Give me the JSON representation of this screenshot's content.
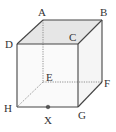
{
  "diagram": {
    "type": "cube",
    "vertices": {
      "A": {
        "label": "A",
        "x": 43,
        "y": 20
      },
      "B": {
        "label": "B",
        "x": 102,
        "y": 20
      },
      "C": {
        "label": "C",
        "x": 78,
        "y": 44
      },
      "D": {
        "label": "D",
        "x": 17,
        "y": 44
      },
      "E": {
        "label": "E",
        "x": 43,
        "y": 82
      },
      "F": {
        "label": "F",
        "x": 102,
        "y": 82
      },
      "G": {
        "label": "G",
        "x": 78,
        "y": 107
      },
      "H": {
        "label": "H",
        "x": 17,
        "y": 107
      }
    },
    "point": {
      "label": "X",
      "x": 48,
      "y": 107,
      "on_edge": "HG"
    },
    "hidden_edges": [
      "AE",
      "EF",
      "EH"
    ],
    "shaded_face": "ABCD",
    "colors": {
      "edge": "#444444",
      "hidden_edge": "#666666",
      "top_face": "#e6e6e6",
      "side_face": "#f7f7f7",
      "front_face": "#fafafa",
      "label": "#333333"
    }
  }
}
